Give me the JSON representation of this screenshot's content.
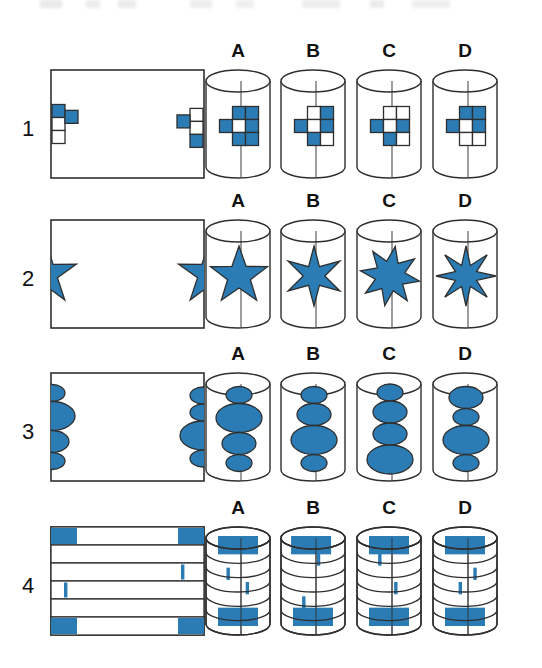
{
  "page": {
    "type": "spatial-reasoning-test",
    "background_color": "#ffffff",
    "ink_color": "#2f2f2f",
    "fill_color": "#2b7cb5",
    "top_cut_text": ""
  },
  "column_labels": [
    "A",
    "B",
    "C",
    "D"
  ],
  "rows": [
    {
      "number": "1",
      "shape_kind": "cross-grid",
      "flat_pattern": {
        "name": "flat-pattern-1",
        "left_half_cross": {
          "cells": [
            {
              "pos": "top",
              "fill": "blue"
            },
            {
              "pos": "middle",
              "fill": "white"
            },
            {
              "pos": "middle-right-arm",
              "fill": "blue"
            },
            {
              "pos": "bottom",
              "fill": "white"
            }
          ]
        },
        "right_half_cross": {
          "cells": [
            {
              "pos": "top",
              "fill": "white"
            },
            {
              "pos": "middle-left-arm",
              "fill": "blue"
            },
            {
              "pos": "middle",
              "fill": "white"
            },
            {
              "pos": "bottom",
              "fill": "blue"
            }
          ]
        }
      },
      "options": [
        {
          "label": "A",
          "cells": {
            "top_left": "blue",
            "top_right": "blue",
            "left": "blue",
            "center": "white",
            "right": "blue",
            "bottom_left": "blue",
            "bottom_right": "blue"
          }
        },
        {
          "label": "B",
          "cells": {
            "top_left": "white",
            "top_right": "blue",
            "left": "blue",
            "center": "white",
            "right": "blue",
            "bottom_left": "blue",
            "bottom_right": "white"
          }
        },
        {
          "label": "C",
          "cells": {
            "top_left": "white",
            "top_right": "white",
            "left": "blue",
            "center": "white",
            "right": "blue",
            "bottom_left": "blue",
            "bottom_right": "white"
          }
        },
        {
          "label": "D",
          "cells": {
            "top_left": "blue",
            "top_right": "blue",
            "left": "blue",
            "center": "white",
            "right": "blue",
            "bottom_left": "white",
            "bottom_right": "white"
          }
        }
      ]
    },
    {
      "number": "2",
      "shape_kind": "star",
      "flat_pattern": {
        "name": "flat-pattern-2",
        "left_half_star": {
          "points": 5,
          "half": "right-half-visible"
        },
        "right_half_star": {
          "points": 5,
          "half": "left-half-visible"
        }
      },
      "options": [
        {
          "label": "A",
          "star_points": 5,
          "inner_ratio": 0.4,
          "rotation": 0
        },
        {
          "label": "B",
          "star_points": 6,
          "inner_ratio": 0.36,
          "rotation": 0
        },
        {
          "label": "C",
          "star_points": 8,
          "inner_ratio": 0.5,
          "rotation": 10
        },
        {
          "label": "D",
          "star_points": 8,
          "inner_ratio": 0.38,
          "rotation": 0
        }
      ]
    },
    {
      "number": "3",
      "shape_kind": "ellipse-stack",
      "flat_pattern": {
        "name": "flat-pattern-3",
        "left_half_stack": [
          {
            "size": "small"
          },
          {
            "size": "large"
          },
          {
            "size": "medium"
          },
          {
            "size": "small"
          }
        ],
        "right_half_stack": [
          {
            "size": "small"
          },
          {
            "size": "small"
          },
          {
            "size": "large"
          },
          {
            "size": "small"
          }
        ]
      },
      "options": [
        {
          "label": "A",
          "stack": [
            "small",
            "large",
            "medium",
            "small"
          ]
        },
        {
          "label": "B",
          "stack": [
            "small",
            "medium",
            "large",
            "small"
          ]
        },
        {
          "label": "C",
          "stack": [
            "small",
            "medium",
            "medium",
            "large"
          ]
        },
        {
          "label": "D",
          "stack": [
            "medium",
            "small",
            "large",
            "small"
          ]
        }
      ]
    },
    {
      "number": "4",
      "shape_kind": "banded",
      "flat_pattern": {
        "name": "flat-pattern-4",
        "bands": [
          {
            "index": 1,
            "marks": [
              {
                "type": "wide",
                "x": "left-edge"
              },
              {
                "type": "wide",
                "x": "right-edge"
              }
            ]
          },
          {
            "index": 2,
            "marks": []
          },
          {
            "index": 3,
            "marks": [
              {
                "type": "thin",
                "x": "right-inner"
              }
            ]
          },
          {
            "index": 4,
            "marks": [
              {
                "type": "thin",
                "x": "left-inner"
              }
            ]
          },
          {
            "index": 5,
            "marks": []
          },
          {
            "index": 6,
            "marks": [
              {
                "type": "wide",
                "x": "left-edge"
              },
              {
                "type": "wide",
                "x": "right-edge"
              }
            ]
          }
        ]
      },
      "options": [
        {
          "label": "A",
          "bands": [
            {
              "index": 1,
              "marks": [
                {
                  "type": "wide",
                  "pos": 0.5
                }
              ]
            },
            {
              "index": 2,
              "marks": []
            },
            {
              "index": 3,
              "marks": [
                {
                  "type": "thin",
                  "pos": 0.32
                }
              ]
            },
            {
              "index": 4,
              "marks": [
                {
                  "type": "thin",
                  "pos": 0.62
                }
              ]
            },
            {
              "index": 5,
              "marks": []
            },
            {
              "index": 6,
              "marks": [
                {
                  "type": "wide",
                  "pos": 0.5
                }
              ]
            }
          ]
        },
        {
          "label": "B",
          "bands": [
            {
              "index": 1,
              "marks": [
                {
                  "type": "wide",
                  "pos": 0.42
                }
              ]
            },
            {
              "index": 2,
              "marks": [
                {
                  "type": "thin",
                  "pos": 0.56
                }
              ]
            },
            {
              "index": 3,
              "marks": []
            },
            {
              "index": 4,
              "marks": []
            },
            {
              "index": 5,
              "marks": [
                {
                  "type": "thin",
                  "pos": 0.33
                }
              ]
            },
            {
              "index": 6,
              "marks": [
                {
                  "type": "wide",
                  "pos": 0.5
                }
              ]
            }
          ]
        },
        {
          "label": "C",
          "bands": [
            {
              "index": 1,
              "marks": [
                {
                  "type": "wide",
                  "pos": 0.5
                }
              ]
            },
            {
              "index": 2,
              "marks": [
                {
                  "type": "thin",
                  "pos": 0.33
                }
              ]
            },
            {
              "index": 3,
              "marks": []
            },
            {
              "index": 4,
              "marks": [
                {
                  "type": "thin",
                  "pos": 0.58
                }
              ]
            },
            {
              "index": 5,
              "marks": []
            },
            {
              "index": 6,
              "marks": [
                {
                  "type": "wide",
                  "pos": 0.5
                }
              ]
            }
          ]
        },
        {
          "label": "D",
          "bands": [
            {
              "index": 1,
              "marks": [
                {
                  "type": "wide",
                  "pos": 0.5
                }
              ]
            },
            {
              "index": 2,
              "marks": []
            },
            {
              "index": 3,
              "marks": [
                {
                  "type": "thin",
                  "pos": 0.63
                }
              ]
            },
            {
              "index": 4,
              "marks": [
                {
                  "type": "thin",
                  "pos": 0.4
                }
              ]
            },
            {
              "index": 5,
              "marks": []
            },
            {
              "index": 6,
              "marks": [
                {
                  "type": "wide",
                  "pos": 0.5
                }
              ]
            }
          ]
        }
      ]
    }
  ]
}
